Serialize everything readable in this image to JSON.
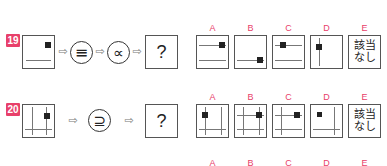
{
  "questions": [
    {
      "number": "19",
      "operators": [
        "≡",
        "∝"
      ],
      "answer_placeholder": "?",
      "options": [
        {
          "label": "A"
        },
        {
          "label": "B"
        },
        {
          "label": "C"
        },
        {
          "label": "D"
        },
        {
          "label": "E",
          "text_line1": "該当",
          "text_line2": "なし"
        }
      ]
    },
    {
      "number": "20",
      "operators": [
        "⊇"
      ],
      "answer_placeholder": "?",
      "options": [
        {
          "label": "A"
        },
        {
          "label": "B"
        },
        {
          "label": "C"
        },
        {
          "label": "D"
        },
        {
          "label": "E",
          "text_line1": "該当",
          "text_line2": "なし"
        }
      ]
    },
    {
      "option_labels": [
        "A",
        "B",
        "C",
        "D",
        "E"
      ]
    }
  ],
  "colors": {
    "accent": "#e8406a",
    "line": "#777777",
    "marker": "#222222"
  }
}
